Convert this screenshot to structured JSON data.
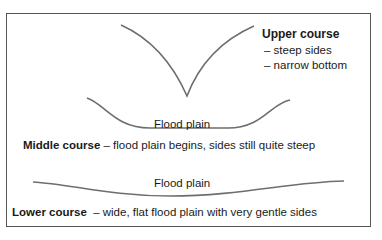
{
  "diagram": {
    "upper": {
      "title": "Upper course",
      "points": [
        "– steep sides",
        "– narrow bottom"
      ]
    },
    "middle": {
      "floodplain_label": "Flood plain",
      "title": "Middle course",
      "description": " – flood plain begins, sides still quite steep"
    },
    "lower": {
      "floodplain_label": "Flood plain",
      "title": "Lower course",
      "description": "  – wide, flat flood plain with very gentle sides"
    },
    "colors": {
      "curve": "#6e6e6e",
      "border": "#555555",
      "text": "#1a1a1a"
    }
  }
}
